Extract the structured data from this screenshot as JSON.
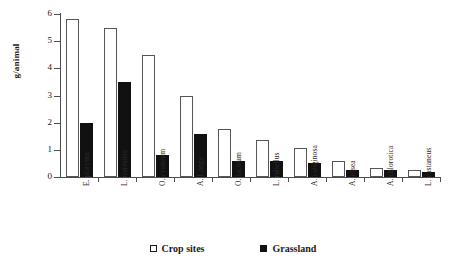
{
  "chart_data": {
    "type": "bar",
    "title": "",
    "xlabel": "",
    "ylabel": "g/animal",
    "ylim": [
      0,
      6
    ],
    "yticks": [
      0,
      1,
      2,
      3,
      4,
      5,
      6
    ],
    "grid": false,
    "legend_position": "bottom",
    "categories": [
      "E. platyura",
      "L. terrestris",
      "O. cyaneum",
      "A. Longa",
      "O. lacteum",
      "L. rubellus",
      "A. caliginosa",
      "A. rosea",
      "A. chlorotica",
      "L. castaneus"
    ],
    "series": [
      {
        "name": "Crop sites",
        "color": "#ffffff",
        "edge_color": "#555555",
        "values": [
          5.8,
          5.5,
          4.5,
          3.0,
          1.75,
          1.35,
          1.05,
          0.6,
          0.35,
          0.25
        ]
      },
      {
        "name": "Grassland",
        "color": "#111111",
        "edge_color": "#111111",
        "values": [
          2.0,
          3.5,
          0.8,
          1.6,
          0.6,
          0.6,
          0.5,
          0.25,
          0.25,
          0.2
        ]
      }
    ]
  },
  "legend": {
    "items": [
      {
        "label": "Crop sites",
        "swatch": "open-square-icon"
      },
      {
        "label": "Grassland",
        "swatch": "filled-square-icon"
      }
    ]
  },
  "axes": {
    "y_title": "g/animal"
  }
}
